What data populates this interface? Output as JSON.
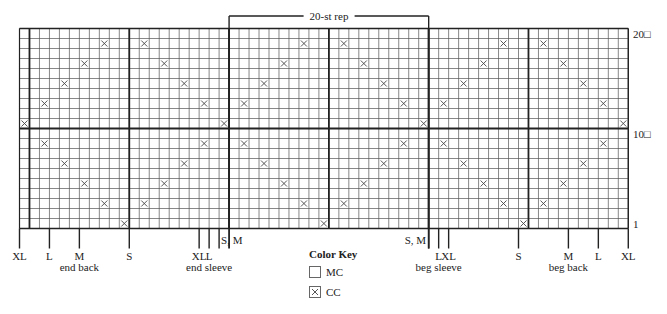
{
  "chart_data": {
    "type": "heatmap",
    "columns": 61,
    "rows": 20,
    "repeat": {
      "label": "20-st rep",
      "start_boundary": 21,
      "end_boundary": 41,
      "width": 20
    },
    "thick_col_boundaries": [
      1,
      11,
      21,
      31,
      41,
      51
    ],
    "thick_row_boundary_after_row": 10,
    "row_labels": [
      {
        "row": 20,
        "text": "20□"
      },
      {
        "row": 10,
        "text": "10□"
      },
      {
        "row": 1,
        "text": "1"
      }
    ],
    "cc_pattern_by_col_mod20": {
      "0": [
        11
      ],
      "2": [
        13,
        9
      ],
      "4": [
        15,
        7
      ],
      "6": [
        17,
        5
      ],
      "8": [
        19,
        3
      ],
      "10": [
        1
      ],
      "12": [
        19,
        3
      ],
      "14": [
        17,
        5
      ],
      "16": [
        15,
        7
      ],
      "18": [
        13,
        9
      ]
    },
    "size_markers": [
      {
        "boundary": 0,
        "label": "XL",
        "sub": ""
      },
      {
        "boundary": 3,
        "label": "L",
        "sub": ""
      },
      {
        "boundary": 6,
        "label": "M",
        "sub": "end back"
      },
      {
        "boundary": 11,
        "label": "S",
        "sub": ""
      },
      {
        "boundary": 18,
        "label": "XL",
        "sub": ""
      },
      {
        "boundary": 19,
        "label": "L",
        "sub": "end sleeve"
      },
      {
        "boundary": 20,
        "label": "S, M",
        "sub": "",
        "side": "right"
      },
      {
        "boundary": 41,
        "label": "S, M",
        "sub": "",
        "side": "left"
      },
      {
        "boundary": 42,
        "label": "L",
        "sub": "beg sleeve"
      },
      {
        "boundary": 43,
        "label": "XL",
        "sub": ""
      },
      {
        "boundary": 50,
        "label": "S",
        "sub": ""
      },
      {
        "boundary": 55,
        "label": "M",
        "sub": "beg back"
      },
      {
        "boundary": 58,
        "label": "L",
        "sub": ""
      },
      {
        "boundary": 61,
        "label": "XL",
        "sub": ""
      }
    ]
  },
  "key": {
    "title": "Color Key",
    "items": [
      {
        "symbol": "blank",
        "label": "MC"
      },
      {
        "symbol": "x",
        "label": "CC"
      }
    ]
  },
  "labels": {
    "end_back": "end back",
    "end_sleeve": "end sleeve",
    "beg_sleeve": "beg sleeve",
    "beg_back": "beg back"
  }
}
